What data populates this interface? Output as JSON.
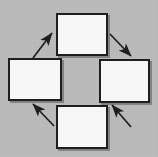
{
  "diagram": {
    "type": "cycle-diagram",
    "title": "",
    "background_color": "#bcbcbc",
    "box_fill_color": "#fbfbfb",
    "box_border_color": "#1a1a1a",
    "arrow_color": "#1a1a1a",
    "direction": "counter-clockwise",
    "node_count": 4,
    "arrow_count": 4,
    "nodes": [
      {
        "id": "top",
        "label": "",
        "x": 56,
        "y": 13,
        "width": 52,
        "height": 43
      },
      {
        "id": "left",
        "label": "",
        "x": 8,
        "y": 58,
        "width": 54,
        "height": 43
      },
      {
        "id": "right",
        "label": "",
        "x": 99,
        "y": 59,
        "width": 51,
        "height": 44
      },
      {
        "id": "bottom",
        "label": "",
        "x": 56,
        "y": 105,
        "width": 52,
        "height": 44
      }
    ],
    "arrows": [
      {
        "id": "left-to-top",
        "from": "left",
        "to": "top",
        "label": "",
        "direction": "up-right"
      },
      {
        "id": "top-to-right",
        "from": "top",
        "to": "right",
        "label": "",
        "direction": "down-right"
      },
      {
        "id": "right-to-bottom",
        "from": "right",
        "to": "bottom",
        "label": "",
        "direction": "down-left"
      },
      {
        "id": "bottom-to-left",
        "from": "bottom",
        "to": "left",
        "label": "",
        "direction": "up-left"
      }
    ]
  }
}
